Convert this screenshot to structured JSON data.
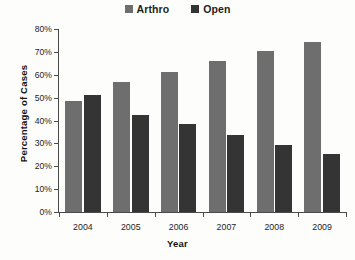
{
  "chart_data": {
    "type": "bar",
    "title": "",
    "xlabel": "Year",
    "ylabel": "Percentage of Cases",
    "categories": [
      "2004",
      "2005",
      "2006",
      "2007",
      "2008",
      "2009"
    ],
    "series": [
      {
        "name": "Arthro",
        "color": "#6e6e6e",
        "values": [
          48.5,
          57.0,
          61.3,
          66.0,
          70.2,
          74.2
        ]
      },
      {
        "name": "Open",
        "color": "#343434",
        "values": [
          51.0,
          42.5,
          38.6,
          33.5,
          29.3,
          25.5
        ]
      }
    ],
    "ylim": [
      0,
      80
    ],
    "yticks": [
      0,
      10,
      20,
      30,
      40,
      50,
      60,
      70,
      80
    ],
    "ytick_labels": [
      "0%",
      "10%",
      "20%",
      "30%",
      "40%",
      "50%",
      "60%",
      "70%",
      "80%"
    ],
    "grid": false,
    "legend_position": "top-center",
    "y_axis_unit": "%"
  },
  "legend": {
    "entries": [
      {
        "label": "Arthro",
        "color": "#6e6e6e"
      },
      {
        "label": "Open",
        "color": "#343434"
      }
    ]
  },
  "axes": {
    "x_title": "Year",
    "y_title": "Percentage of Cases"
  }
}
